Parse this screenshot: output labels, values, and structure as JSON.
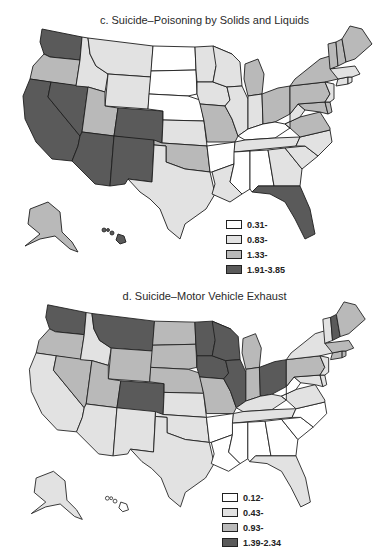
{
  "panels": {
    "c": {
      "title": "c. Suicide–Poisoning by Solids and Liquids",
      "legend": [
        {
          "label": "0.31-",
          "color": "#ffffff"
        },
        {
          "label": "0.83-",
          "color": "#e2e2e2"
        },
        {
          "label": "1.33-",
          "color": "#b9b9b9"
        },
        {
          "label": "1.91-3.85",
          "color": "#5a5a5a"
        }
      ],
      "states": {
        "WA": 3,
        "OR": 2,
        "CA": 3,
        "NV": 3,
        "ID": 1,
        "MT": 1,
        "WY": 1,
        "UT": 2,
        "CO": 3,
        "AZ": 3,
        "NM": 3,
        "ND": 0,
        "SD": 0,
        "NE": 0,
        "KS": 1,
        "OK": 2,
        "TX": 1,
        "MN": 1,
        "IA": 1,
        "MO": 2,
        "AR": 0,
        "LA": 1,
        "WI": 1,
        "IL": 1,
        "MI": 2,
        "IN": 1,
        "OH": 2,
        "KY": 0,
        "TN": 1,
        "MS": 0,
        "AL": 0,
        "GA": 1,
        "FL": 3,
        "SC": 1,
        "NC": 1,
        "VA": 2,
        "WV": 1,
        "MD": 2,
        "DE": 2,
        "PA": 2,
        "NY": 2,
        "NJ": 1,
        "CT": 1,
        "RI": 1,
        "MA": 1,
        "VT": 2,
        "NH": 2,
        "ME": 2,
        "AK": 2,
        "HI": 3
      }
    },
    "d": {
      "title": "d. Suicide–Motor Vehicle Exhaust",
      "legend": [
        {
          "label": "0.12-",
          "color": "#ffffff"
        },
        {
          "label": "0.43-",
          "color": "#e2e2e2"
        },
        {
          "label": "0.93-",
          "color": "#b9b9b9"
        },
        {
          "label": "1.39-2.34",
          "color": "#5a5a5a"
        }
      ],
      "states": {
        "WA": 3,
        "OR": 2,
        "CA": 1,
        "NV": 2,
        "ID": 1,
        "MT": 3,
        "WY": 2,
        "UT": 2,
        "CO": 3,
        "AZ": 1,
        "NM": 1,
        "ND": 2,
        "SD": 2,
        "NE": 2,
        "KS": 1,
        "OK": 1,
        "TX": 1,
        "MN": 3,
        "IA": 3,
        "MO": 2,
        "AR": 0,
        "LA": 0,
        "WI": 3,
        "IL": 3,
        "MI": 2,
        "IN": 2,
        "OH": 3,
        "KY": 1,
        "TN": 1,
        "MS": 0,
        "AL": 0,
        "GA": 0,
        "FL": 1,
        "SC": 0,
        "NC": 0,
        "VA": 1,
        "WV": 0,
        "MD": 1,
        "DE": 1,
        "PA": 2,
        "NY": 1,
        "NJ": 1,
        "CT": 2,
        "RI": 2,
        "MA": 2,
        "VT": 1,
        "NH": 3,
        "ME": 2,
        "AK": 1,
        "HI": 0
      }
    }
  }
}
